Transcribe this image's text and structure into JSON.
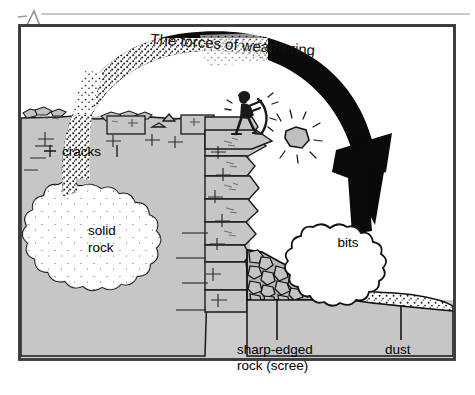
{
  "page": {
    "annotation_mark": "A",
    "background_color": "#ffffff",
    "rule_color": "#b9b9b9"
  },
  "figure": {
    "frame": {
      "border_color": "#3b3b3b",
      "fill_color": "#cccccc"
    },
    "title": "The forces of weathering",
    "labels": {
      "cracks": "cracks",
      "solid_rock_line1": "solid",
      "solid_rock_line2": "rock",
      "bits": "bits",
      "scree_line1": "sharp-edged",
      "scree_line2": "rock (scree)",
      "dust": "dust"
    },
    "elements": {
      "arrow_name": "weathering-arrow",
      "arrow_color": "#000000",
      "cloud_fill": "#ffffff",
      "rock_fill": "#c6c6c6",
      "scree_fill": "#b7b7b7",
      "dust_fill": "#ffffff",
      "person_color": "#1a1a1a"
    }
  }
}
